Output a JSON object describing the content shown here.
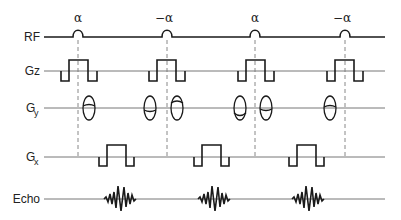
{
  "diagram": {
    "title": "",
    "type": "MRI pulse sequence timing diagram",
    "rows": [
      {
        "id": "rf",
        "label": "RF",
        "subscript": ""
      },
      {
        "id": "gz",
        "label": "Gz",
        "subscript": ""
      },
      {
        "id": "gy",
        "label": "G",
        "subscript": "y"
      },
      {
        "id": "gx",
        "label": "G",
        "subscript": "x"
      },
      {
        "id": "echo",
        "label": "Echo",
        "subscript": ""
      }
    ],
    "rf_pulses": [
      {
        "flip_label": "α"
      },
      {
        "flip_label": "−α"
      },
      {
        "flip_label": "α"
      },
      {
        "flip_label": "−α"
      }
    ],
    "colors": {
      "waveform": "#1a1a1a",
      "baseline": "#777777",
      "dashed_marker": "#888888",
      "background": "#ffffff"
    }
  }
}
